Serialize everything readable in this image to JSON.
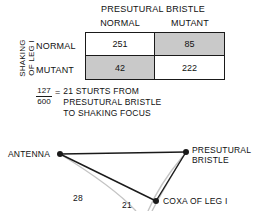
{
  "table": {
    "column_group_title": "PRESUTURAL BRISTLE",
    "row_group_title_line1": "SHAKING",
    "row_group_title_line2": "OF LEG I",
    "column_headers": [
      "NORMAL",
      "MUTANT"
    ],
    "row_headers": [
      "NORMAL",
      "MUTANT"
    ],
    "cells": [
      [
        {
          "value": "251",
          "shade": "white"
        },
        {
          "value": "85",
          "shade": "gray"
        }
      ],
      [
        {
          "value": "42",
          "shade": "gray"
        },
        {
          "value": "222",
          "shade": "white"
        }
      ]
    ],
    "border_color": "#1a1a1a",
    "shade_color": "#c9c9c9"
  },
  "equation": {
    "numerator": "127",
    "denominator": "600",
    "equals": "=",
    "text_line1": "21 STURTS  FROM",
    "text_line2": "PRESUTURAL BRISTLE",
    "text_line3": "TO SHAKING FOCUS"
  },
  "map": {
    "nodes": [
      {
        "id": "antenna",
        "label": "ANTENNA",
        "x": 60,
        "y": 24
      },
      {
        "id": "presutural",
        "label_line1": "PRESUTURAL",
        "label_line2": "BRISTLE",
        "x": 186,
        "y": 22
      },
      {
        "id": "coxa",
        "label": "COXA OF LEG I",
        "x": 156,
        "y": 71
      }
    ],
    "distances": [
      {
        "value": "28",
        "between": "antenna-coxa"
      },
      {
        "value": "21",
        "between": "presutural-coxa"
      }
    ],
    "line_color": "#1a1a1a",
    "arc_color": "#c4c4c4"
  }
}
